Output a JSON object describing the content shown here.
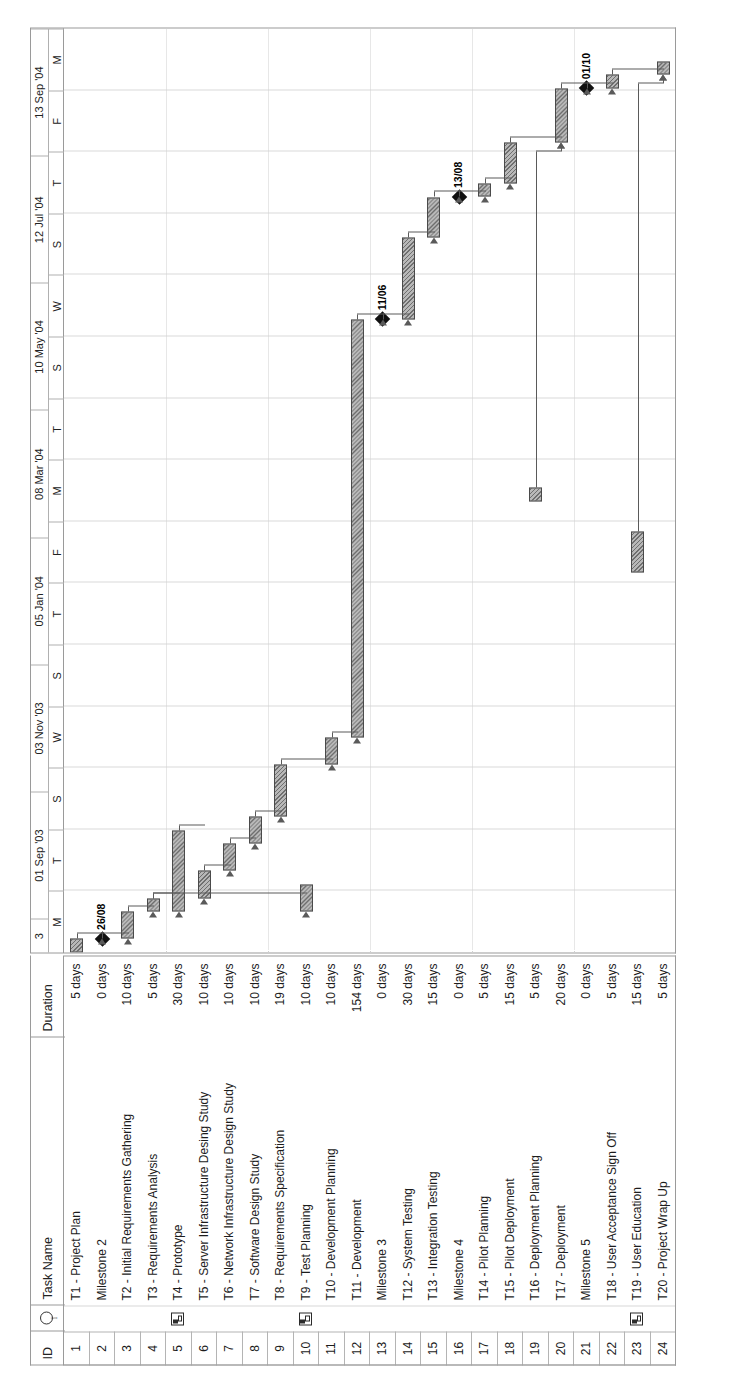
{
  "chart_data": {
    "type": "table",
    "columns": [
      "ID",
      "Indicator",
      "Task Name",
      "Duration"
    ],
    "timescale": {
      "major_label_format": "dd Mmm 'yy",
      "major_labels": [
        "3",
        "01 Sep '03",
        "03 Nov '03",
        "05 Jan '04",
        "08 Mar '04",
        "10 May '04",
        "12 Jul '04",
        "13 Sep '04"
      ],
      "minor_labels": [
        "M",
        "T",
        "S",
        "W",
        "S",
        "T",
        "F",
        "M",
        "T",
        "S",
        "W",
        "S",
        "T",
        "F",
        "M"
      ],
      "range_start": "01 Sep '03",
      "range_end": "13 Sep '04"
    },
    "rows": [
      {
        "id": "1",
        "indicator": "",
        "name": "T1 - Project Plan",
        "duration": "5 days",
        "bar": {
          "type": "task",
          "start": 0,
          "length": 5
        }
      },
      {
        "id": "2",
        "indicator": "",
        "name": "Milestone 2",
        "duration": "0 days",
        "bar": {
          "type": "milestone",
          "start": 5,
          "length": 0,
          "label": "26/08"
        }
      },
      {
        "id": "3",
        "indicator": "",
        "name": "T2 - Initial Requirements Gathering",
        "duration": "10 days",
        "bar": {
          "type": "task",
          "start": 5,
          "length": 10
        }
      },
      {
        "id": "4",
        "indicator": "",
        "name": "T3 - Requirements Analysis",
        "duration": "5 days",
        "bar": {
          "type": "task",
          "start": 15,
          "length": 5
        }
      },
      {
        "id": "5",
        "indicator": "note-icon",
        "name": "T4 - Prototype",
        "duration": "30 days",
        "bar": {
          "type": "task",
          "start": 15,
          "length": 30
        }
      },
      {
        "id": "6",
        "indicator": "",
        "name": "T5 - Server Infrastructure Desing Study",
        "duration": "10 days",
        "bar": {
          "type": "task",
          "start": 20,
          "length": 10
        }
      },
      {
        "id": "7",
        "indicator": "",
        "name": "T6 - Network Infrastructure Design Study",
        "duration": "10 days",
        "bar": {
          "type": "task",
          "start": 30,
          "length": 10
        }
      },
      {
        "id": "8",
        "indicator": "",
        "name": "T7 - Software Design Study",
        "duration": "10 days",
        "bar": {
          "type": "task",
          "start": 40,
          "length": 10
        }
      },
      {
        "id": "9",
        "indicator": "",
        "name": "T8 - Requirements Specification",
        "duration": "19 days",
        "bar": {
          "type": "task",
          "start": 50,
          "length": 19
        }
      },
      {
        "id": "10",
        "indicator": "note-icon",
        "name": "T9 - Test Planning",
        "duration": "10 days",
        "bar": {
          "type": "task",
          "start": 15,
          "length": 10
        }
      },
      {
        "id": "11",
        "indicator": "",
        "name": "T10 - Development Planning",
        "duration": "10 days",
        "bar": {
          "type": "task",
          "start": 69,
          "length": 10
        }
      },
      {
        "id": "12",
        "indicator": "",
        "name": "T11 - Development",
        "duration": "154 days",
        "bar": {
          "type": "task",
          "start": 79,
          "length": 154
        }
      },
      {
        "id": "13",
        "indicator": "",
        "name": "Milestone 3",
        "duration": "0 days",
        "bar": {
          "type": "milestone",
          "start": 233,
          "length": 0,
          "label": "11/06"
        }
      },
      {
        "id": "14",
        "indicator": "",
        "name": "T12 - System Testing",
        "duration": "30 days",
        "bar": {
          "type": "task",
          "start": 233,
          "length": 30
        }
      },
      {
        "id": "15",
        "indicator": "",
        "name": "T13 - Integration Testing",
        "duration": "15 days",
        "bar": {
          "type": "task",
          "start": 263,
          "length": 15
        }
      },
      {
        "id": "16",
        "indicator": "",
        "name": "Milestone 4",
        "duration": "0 days",
        "bar": {
          "type": "milestone",
          "start": 278,
          "length": 0,
          "label": "13/08"
        }
      },
      {
        "id": "17",
        "indicator": "",
        "name": "T14 - Pilot Planning",
        "duration": "5 days",
        "bar": {
          "type": "task",
          "start": 278,
          "length": 5
        }
      },
      {
        "id": "18",
        "indicator": "",
        "name": "T15 - Pilot Deployment",
        "duration": "15 days",
        "bar": {
          "type": "task",
          "start": 283,
          "length": 15
        }
      },
      {
        "id": "19",
        "indicator": "",
        "name": "T16 - Deployment Planning",
        "duration": "5 days",
        "bar": {
          "type": "task",
          "start": 166,
          "length": 5
        }
      },
      {
        "id": "20",
        "indicator": "",
        "name": "T17 - Deployment",
        "duration": "20 days",
        "bar": {
          "type": "task",
          "start": 298,
          "length": 20
        }
      },
      {
        "id": "21",
        "indicator": "",
        "name": "Milestone 5",
        "duration": "0 days",
        "bar": {
          "type": "milestone",
          "start": 318,
          "length": 0,
          "label": "01/10"
        }
      },
      {
        "id": "22",
        "indicator": "",
        "name": "T18 - User Acceptance Sign Off",
        "duration": "5 days",
        "bar": {
          "type": "task",
          "start": 318,
          "length": 5
        }
      },
      {
        "id": "23",
        "indicator": "note-icon",
        "name": "T19 - User Education",
        "duration": "15 days",
        "bar": {
          "type": "task",
          "start": 140,
          "length": 15
        }
      },
      {
        "id": "24",
        "indicator": "",
        "name": "T20 - Project Wrap Up",
        "duration": "5 days",
        "bar": {
          "type": "task",
          "start": 323,
          "length": 5
        }
      }
    ],
    "milestones": [
      {
        "label": "26/08",
        "row": 2
      },
      {
        "label": "11/06",
        "row": 13
      },
      {
        "label": "13/08",
        "row": 16
      },
      {
        "label": "01/10",
        "row": 21
      }
    ],
    "legend": {
      "bar_fill": "#b8b8b8",
      "bar_border": "#4a4a4a",
      "milestone_color": "#111111",
      "link_color": "#5a5a5a"
    }
  }
}
